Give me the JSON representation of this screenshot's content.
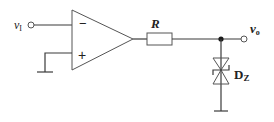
{
  "diagram": {
    "type": "circuit",
    "labels": {
      "input": "v",
      "input_sub": "I",
      "output": "v",
      "output_sub": "o",
      "resistor": "R",
      "zener": "D",
      "zener_sub": "Z",
      "inverting": "−",
      "noninverting": "+"
    },
    "components": [
      {
        "id": "opamp",
        "kind": "operational-amplifier"
      },
      {
        "id": "R",
        "kind": "resistor"
      },
      {
        "id": "DZ",
        "kind": "bidirectional-zener-diode"
      },
      {
        "id": "gnd1",
        "kind": "ground"
      },
      {
        "id": "gnd2",
        "kind": "ground"
      }
    ],
    "colors": {
      "line": "#3a3a3a",
      "text": "#222222",
      "background": "#ffffff"
    }
  }
}
